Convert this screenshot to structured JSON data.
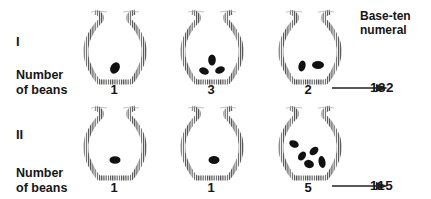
{
  "header": {
    "line1": "Base-ten",
    "line2": "numeral"
  },
  "rows": [
    {
      "label": "I",
      "beans_label_line1": "Number",
      "beans_label_line2": "of beans",
      "pots": [
        {
          "count": "1"
        },
        {
          "count": "3"
        },
        {
          "count": "2"
        }
      ],
      "numeral": "132"
    },
    {
      "label": "II",
      "beans_label_line1": "Number",
      "beans_label_line2": "of beans",
      "pots": [
        {
          "count": "1"
        },
        {
          "count": "1"
        },
        {
          "count": "5"
        }
      ],
      "numeral": "115"
    }
  ],
  "colors": {
    "pot_stroke": "#555555",
    "bean": "#111111",
    "text": "#161616"
  }
}
